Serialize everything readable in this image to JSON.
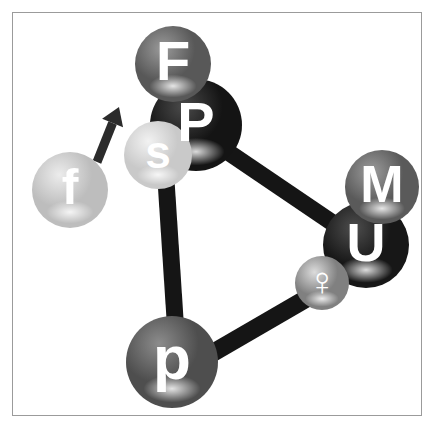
{
  "figure": {
    "background_color": "#ffffff",
    "frame_color": "#9b9b9b",
    "bond_color": "#151515",
    "label_color": "#ffffff"
  },
  "nodes": [
    {
      "id": "node-f",
      "label": "F",
      "name": "atom-sphere-F",
      "cx": 173,
      "cy": 64,
      "r": 38,
      "fill": "#585858",
      "highlight": "#9a9a9a",
      "font_size": 56,
      "z": 5
    },
    {
      "id": "node-P",
      "label": "P",
      "name": "atom-sphere-P",
      "cx": 196,
      "cy": 125,
      "r": 46,
      "fill": "#141414",
      "highlight": "#4a4a4a",
      "font_size": 56,
      "z": 4
    },
    {
      "id": "node-s",
      "label": "s",
      "name": "atom-sphere-s",
      "cx": 158,
      "cy": 155,
      "r": 34,
      "fill": "#c9c9c9",
      "highlight": "#f2f2f2",
      "font_size": 46,
      "z": 6
    },
    {
      "id": "node-f-lower",
      "label": "f",
      "name": "atom-sphere-f",
      "cx": 70,
      "cy": 190,
      "r": 38,
      "fill": "#bdbdbd",
      "highlight": "#ececec",
      "font_size": 50,
      "z": 3
    },
    {
      "id": "node-M",
      "label": "M",
      "name": "atom-sphere-M",
      "cx": 382,
      "cy": 187,
      "r": 37,
      "fill": "#5a5a5a",
      "highlight": "#9c9c9c",
      "font_size": 52,
      "z": 6
    },
    {
      "id": "node-U",
      "label": "U",
      "name": "atom-sphere-U",
      "cx": 366,
      "cy": 245,
      "r": 43,
      "fill": "#171717",
      "highlight": "#4d4d4d",
      "font_size": 54,
      "z": 4
    },
    {
      "id": "node-venus",
      "label": "♀",
      "name": "atom-sphere-venus",
      "cx": 322,
      "cy": 283,
      "r": 27,
      "fill": "#808080",
      "highlight": "#dcdcdc",
      "font_size": 40,
      "z": 7
    },
    {
      "id": "node-p",
      "label": "p",
      "name": "atom-sphere-p",
      "cx": 172,
      "cy": 362,
      "r": 46,
      "fill": "#4e4e4e",
      "highlight": "#8c8c8c",
      "font_size": 62,
      "z": 5
    }
  ],
  "bonds": [
    {
      "name": "bond-P-U",
      "x1": 200,
      "y1": 133,
      "x2": 346,
      "y2": 232,
      "width": 17
    },
    {
      "name": "bond-s-p",
      "x1": 165,
      "y1": 165,
      "x2": 176,
      "y2": 334,
      "width": 17
    },
    {
      "name": "bond-p-venus",
      "x1": 204,
      "y1": 358,
      "x2": 316,
      "y2": 293,
      "width": 18
    },
    {
      "name": "bond-F-P",
      "x1": 176,
      "y1": 92,
      "x2": 186,
      "y2": 112,
      "width": 14
    }
  ],
  "arrow": {
    "name": "direction-arrow",
    "x1": 97,
    "y1": 162,
    "x2": 119,
    "y2": 107,
    "width": 9,
    "head_size": 15,
    "color": "#2b2b2b"
  }
}
